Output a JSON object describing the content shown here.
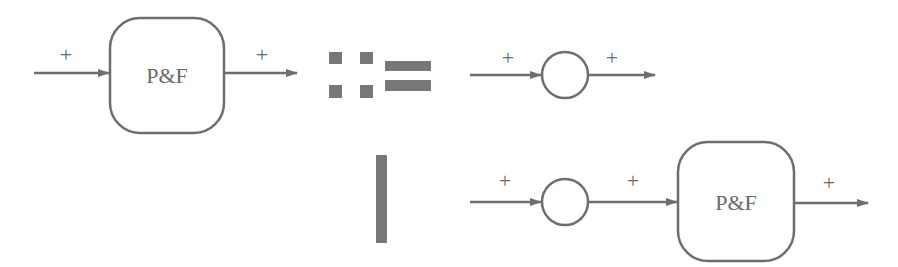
{
  "diagram": {
    "colors": {
      "stroke": "#6e6e6e",
      "symbol": "#777777",
      "text": "#6a6a6a",
      "background": "#ffffff"
    },
    "lhs": {
      "box_label": "P&F",
      "in_sign": "+",
      "out_sign": "+"
    },
    "definition_symbol": "::=",
    "alternative_symbol": "|",
    "rhs_option_1": {
      "node": "circle",
      "in_sign": "+",
      "out_sign": "+"
    },
    "rhs_option_2": {
      "node": "circle",
      "in_sign": "+",
      "mid_sign": "+",
      "box_label": "P&F",
      "out_sign": "+"
    }
  }
}
